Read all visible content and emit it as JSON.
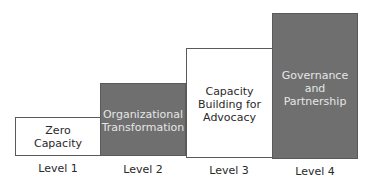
{
  "diagram": {
    "type": "staircase",
    "levels": [
      {
        "label": "Level 1",
        "text": "Zero\nCapacity",
        "style": "light"
      },
      {
        "label": "Level 2",
        "text": "Organizational\nTransformation",
        "style": "dark"
      },
      {
        "label": "Level 3",
        "text": "Capacity\nBuilding for\nAdvocacy",
        "style": "light"
      },
      {
        "label": "Level 4",
        "text": "Governance\nand\nPartnership",
        "style": "dark"
      }
    ]
  },
  "colors": {
    "dark_fill": "#6f6f6f",
    "light_fill": "#ffffff",
    "border": "#5a5a5a",
    "dark_text": "#e6e6e6",
    "light_text": "#2a2a2a"
  }
}
